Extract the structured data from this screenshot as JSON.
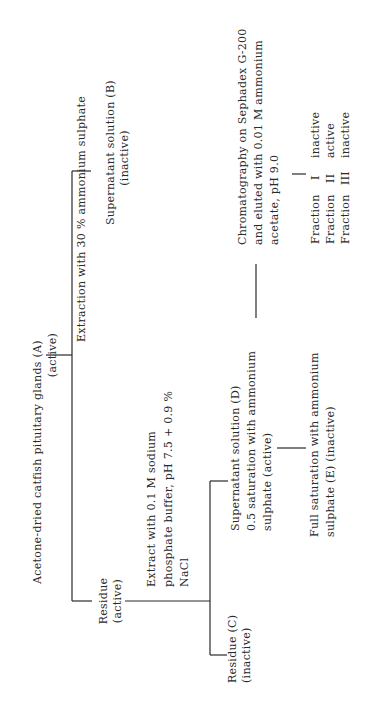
{
  "figure": {
    "root": {
      "label": "Acetone-dried catfish pituitary glands (A)",
      "status": "(active)"
    },
    "step1": {
      "label": "Extraction with 30 % ammonium sulphate"
    },
    "supernatant_b": {
      "label": "Supernatant solution (B)",
      "status": "(inactive)"
    },
    "residue": {
      "label": "Residue",
      "status": "(active)"
    },
    "step2": {
      "lines": [
        "Extract with 0.1 M sodium",
        "phosphate buffer, pH 7.5 + 0.9 %",
        "NaCl"
      ]
    },
    "residue_c": {
      "label": "Residue (C)",
      "status": "(inactive)"
    },
    "supernatant_d": {
      "lines": [
        "Supernatant solution (D)",
        "0.5 saturation with ammonium",
        "sulphate (active)"
      ]
    },
    "full_saturation_e": {
      "lines": [
        "Full saturation with ammonium",
        "sulphate (E)  (inactive)"
      ]
    },
    "chromatography": {
      "lines": [
        "Chromatography on Sephadex G-200",
        "and eluted with 0.01 M ammonium",
        "acetate, pH 9.0"
      ]
    },
    "fractions": [
      {
        "name": "Fraction",
        "numeral": "I",
        "status": "inactive"
      },
      {
        "name": "Fraction",
        "numeral": "II",
        "status": "active"
      },
      {
        "name": "Fraction",
        "numeral": "III",
        "status": "inactive"
      }
    ]
  }
}
